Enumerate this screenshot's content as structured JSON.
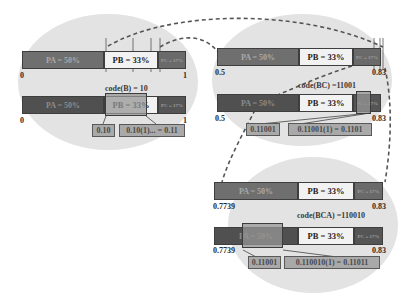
{
  "diagram": {
    "type": "arithmetic-coding-intervals",
    "colors": {
      "ellipse": "#e3e3e3",
      "segment_a": "#6f6f6f",
      "segment_b": "#f2f2f2",
      "segment_c": "#6a6a6a",
      "code_box": "#a9a9a9"
    },
    "panels": [
      {
        "id": "panel-1",
        "top_bar": {
          "segments": [
            "PA = 50%",
            "PB = 33%",
            "PC = 17%"
          ],
          "left": "0",
          "right": "1"
        },
        "code_label": "code(B) = 10",
        "bottom_bar": {
          "segments": [
            "PA = 50%",
            "PB = 33%",
            "PC = 17%"
          ],
          "left": "0",
          "right": "1"
        },
        "boxes": [
          "0.10",
          "0.10(1)... = 0.11"
        ]
      },
      {
        "id": "panel-2",
        "top_bar": {
          "segments": [
            "PA = 50%",
            "PB = 33%",
            "PC = 17%"
          ],
          "left": "0.5",
          "right": "0.83"
        },
        "code_label": "code(BC) =11001",
        "bottom_bar": {
          "segments": [
            "PA = 50%",
            "PB = 33%",
            "PC = 17%"
          ],
          "left": "0.5",
          "right": "0.83"
        },
        "boxes": [
          "0.11001",
          "0.11001(1) = 0.1101"
        ]
      },
      {
        "id": "panel-3",
        "top_bar": {
          "segments": [
            "PA = 50%",
            "PB = 33%",
            "PC = 17%"
          ],
          "left": "0.7739",
          "right": "0.83"
        },
        "code_label": "code(BCA) =110010",
        "bottom_bar": {
          "segments": [
            "PA = 50%",
            "PB = 33%",
            "PC = 17%"
          ],
          "left": "0.7739",
          "right": "0.83"
        },
        "boxes": [
          "0.11001",
          "0.110010(1) = 0.11011"
        ]
      }
    ]
  }
}
